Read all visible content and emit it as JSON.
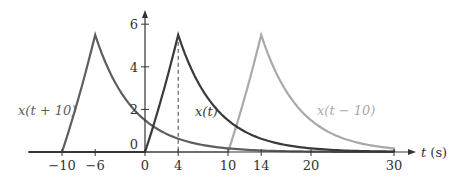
{
  "chart_data": {
    "type": "line",
    "title": "",
    "xlabel": "t (s)",
    "ylabel": "",
    "xlim": [
      -14,
      32
    ],
    "ylim": [
      0,
      6.5
    ],
    "x_ticks": [
      -10,
      -6,
      0,
      4,
      10,
      14,
      20,
      30
    ],
    "y_ticks": [
      0,
      2,
      4,
      6
    ],
    "grid": false,
    "dashed_marker": {
      "t": 4,
      "value": 5.5
    },
    "series": [
      {
        "name": "x(t + 10)",
        "color": "#5e5e5e",
        "rise_start": -10,
        "peak_t": -6,
        "peak": 5.5,
        "decay_to": 20
      },
      {
        "name": "x(t)",
        "color": "#3a3a3a",
        "rise_start": 0,
        "peak_t": 4,
        "peak": 5.5,
        "decay_to": 30
      },
      {
        "name": "x(t − 10)",
        "color": "#a9a9a9",
        "rise_start": 10,
        "peak_t": 14,
        "peak": 5.5,
        "decay_to": 30
      }
    ],
    "annotations": [
      "x(t + 10)",
      "x(t)",
      "x(t − 10)"
    ]
  },
  "labels": {
    "xaxis": "t (s)",
    "series0": "x(t + 10)",
    "series1": "x(t)",
    "series2": "x(t − 10)",
    "xt": [
      "−10",
      "−6",
      "0",
      "4",
      "10",
      "14",
      "20",
      "30"
    ],
    "yt": [
      "0",
      "2",
      "4",
      "6"
    ]
  }
}
